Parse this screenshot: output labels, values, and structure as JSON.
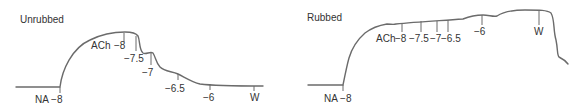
{
  "panels": [
    {
      "title": "Unrubbed",
      "labels": {
        "na": "NA −8",
        "ach": "ACh",
        "c1": "−8",
        "c2": "−7.5",
        "c3": "−7",
        "c4": "−6.5",
        "c5": "−6",
        "wash": "W"
      }
    },
    {
      "title": "Rubbed",
      "labels": {
        "na": "NA −8",
        "ach": "ACh",
        "c1": "−8",
        "c2": "−7.5",
        "c3": "−7",
        "c4": "−6.5",
        "c5": "−6",
        "wash": "W"
      }
    }
  ],
  "colors": {
    "trace": "#6b6b6b",
    "text": "#333333"
  }
}
